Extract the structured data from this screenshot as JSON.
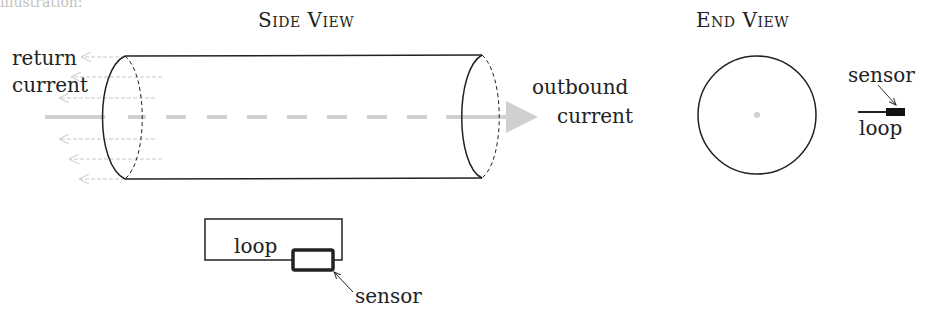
{
  "top_fragment": "illustration:",
  "side_view": {
    "title": "Side View",
    "return_label_line1": "return",
    "return_label_line2": "current",
    "outbound_label_line1": "outbound",
    "outbound_label_line2": "current"
  },
  "end_view": {
    "title": "End View",
    "sensor_label": "sensor",
    "loop_label": "loop"
  },
  "loop_diagram": {
    "loop_label": "loop",
    "sensor_label": "sensor"
  },
  "colors": {
    "stroke": "#222222",
    "current_arrow": "#c8c8c8"
  }
}
